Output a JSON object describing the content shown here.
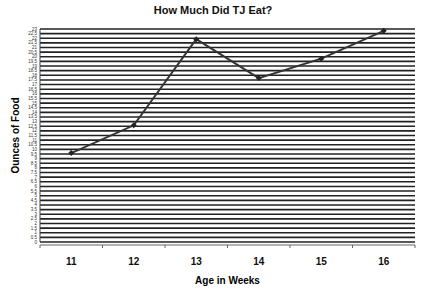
{
  "chart_data": {
    "type": "line",
    "title": "How Much Did TJ Eat?",
    "xlabel": "Age in Weeks",
    "ylabel": "Ounces of Food",
    "categories": [
      "11",
      "12",
      "13",
      "14",
      "15",
      "16"
    ],
    "series": [
      {
        "name": "Ounces of Food",
        "values": [
          9.6,
          12.6,
          21.9,
          17.7,
          19.8,
          22.8
        ]
      }
    ],
    "ylim": [
      0,
      23
    ],
    "ytick_step": 0.5,
    "grid": true,
    "legend": "none"
  }
}
